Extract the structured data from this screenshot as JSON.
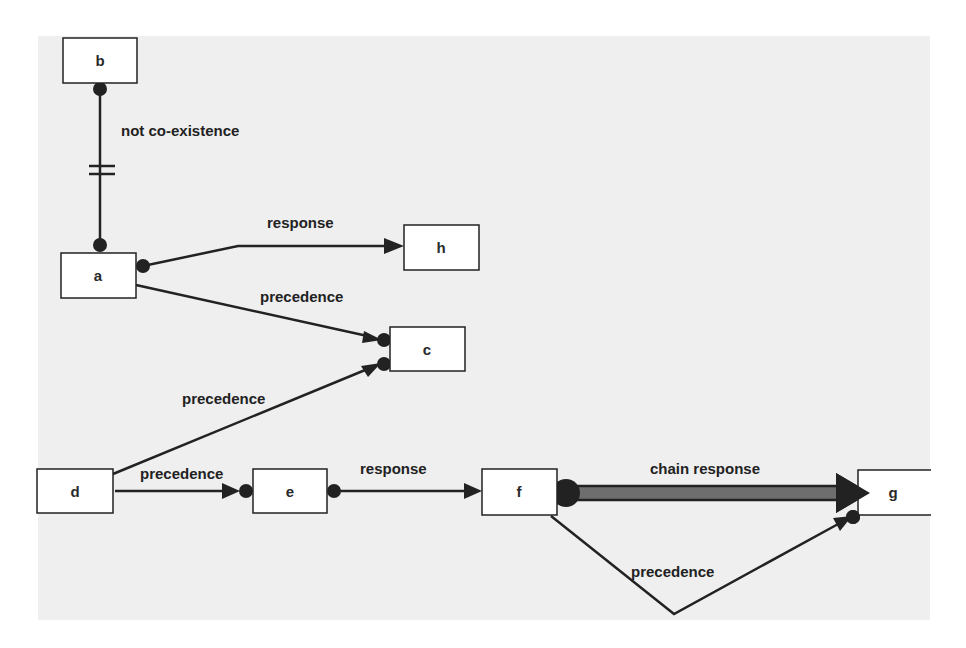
{
  "diagram": {
    "type": "declare-constraint-model",
    "colors": {
      "canvas": "#efefef",
      "node_fill": "#ffffff",
      "node_stroke": "#222222",
      "edge": "#222222",
      "chain_fill": "#6e6e6e"
    },
    "nodes": [
      {
        "id": "b",
        "label": "b",
        "x": 63,
        "y": 38,
        "w": 74,
        "h": 45
      },
      {
        "id": "a",
        "label": "a",
        "x": 61,
        "y": 253,
        "w": 75,
        "h": 45
      },
      {
        "id": "h",
        "label": "h",
        "x": 404,
        "y": 225,
        "w": 75,
        "h": 45
      },
      {
        "id": "c",
        "label": "c",
        "x": 390,
        "y": 327,
        "w": 75,
        "h": 44
      },
      {
        "id": "d",
        "label": "d",
        "x": 37,
        "y": 469,
        "w": 76,
        "h": 44
      },
      {
        "id": "e",
        "label": "e",
        "x": 253,
        "y": 469,
        "w": 74,
        "h": 44
      },
      {
        "id": "f",
        "label": "f",
        "x": 482,
        "y": 469,
        "w": 75,
        "h": 46
      },
      {
        "id": "g",
        "label": "g",
        "x": 858,
        "y": 470,
        "w": 72,
        "h": 45
      }
    ],
    "edges": [
      {
        "from": "b",
        "to": "a",
        "label": "not co-existence",
        "kind": "not-coexistence"
      },
      {
        "from": "a",
        "to": "h",
        "label": "response",
        "kind": "response"
      },
      {
        "from": "a",
        "to": "c",
        "label": "precedence",
        "kind": "precedence"
      },
      {
        "from": "d",
        "to": "c",
        "label": "precedence",
        "kind": "precedence"
      },
      {
        "from": "d",
        "to": "e",
        "label": "precedence",
        "kind": "precedence"
      },
      {
        "from": "e",
        "to": "f",
        "label": "response",
        "kind": "response"
      },
      {
        "from": "f",
        "to": "g",
        "label": "chain response",
        "kind": "chain-response"
      },
      {
        "from": "f",
        "to": "g",
        "label": "precedence",
        "kind": "precedence"
      }
    ]
  }
}
